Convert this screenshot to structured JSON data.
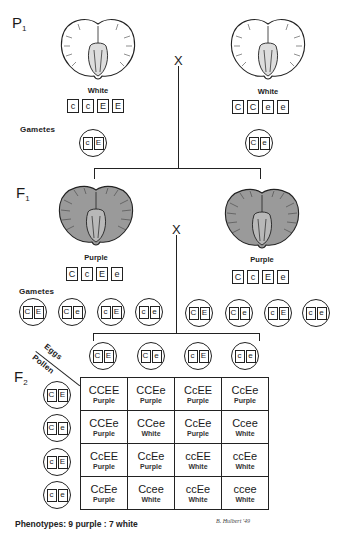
{
  "generations": {
    "p1": "P",
    "p1_sub": "1",
    "f1": "F",
    "f1_sub": "1",
    "f2": "F",
    "f2_sub": "2"
  },
  "cross_symbol": "X",
  "p1": {
    "left": {
      "phenotype": "White",
      "genotype": [
        "c",
        "c",
        "E",
        "E"
      ],
      "gamete": [
        "c",
        "E"
      ],
      "seed_color": "#ffffff"
    },
    "right": {
      "phenotype": "White",
      "genotype": [
        "C",
        "C",
        "e",
        "e"
      ],
      "gamete": [
        "C",
        "e"
      ],
      "seed_color": "#ffffff"
    },
    "gametes_label": "Gametes"
  },
  "f1": {
    "left": {
      "phenotype": "Purple",
      "genotype": [
        "C",
        "c",
        "E",
        "e"
      ],
      "seed_color": "#9a9a9a"
    },
    "right": {
      "phenotype": "Purple",
      "genotype": [
        "C",
        "c",
        "E",
        "e"
      ],
      "seed_color": "#9a9a9a"
    },
    "gametes_label": "Gametes",
    "left_gametes": [
      [
        "C",
        "E"
      ],
      [
        "C",
        "e"
      ],
      [
        "c",
        "E"
      ],
      [
        "c",
        "e"
      ]
    ],
    "right_gametes": [
      [
        "C",
        "E"
      ],
      [
        "C",
        "e"
      ],
      [
        "c",
        "E"
      ],
      [
        "c",
        "e"
      ]
    ]
  },
  "f2": {
    "eggs_label": "Eggs",
    "pollen_label": "Pollen",
    "eggs": [
      [
        "C",
        "E"
      ],
      [
        "C",
        "e"
      ],
      [
        "c",
        "E"
      ],
      [
        "c",
        "e"
      ]
    ],
    "pollen": [
      [
        "C",
        "E"
      ],
      [
        "C",
        "e"
      ],
      [
        "c",
        "E"
      ],
      [
        "c",
        "e"
      ]
    ],
    "grid": [
      [
        {
          "g": "CCEE",
          "p": "Purple"
        },
        {
          "g": "CCEe",
          "p": "Purple"
        },
        {
          "g": "CcEE",
          "p": "Purple"
        },
        {
          "g": "CcEe",
          "p": "Purple"
        }
      ],
      [
        {
          "g": "CCEe",
          "p": "Purple"
        },
        {
          "g": "CCee",
          "p": "White"
        },
        {
          "g": "CcEe",
          "p": "Purple"
        },
        {
          "g": "Ccee",
          "p": "White"
        }
      ],
      [
        {
          "g": "CcEE",
          "p": "Purple"
        },
        {
          "g": "CcEe",
          "p": "Purple"
        },
        {
          "g": "ccEE",
          "p": "White"
        },
        {
          "g": "ccEe",
          "p": "White"
        }
      ],
      [
        {
          "g": "CcEe",
          "p": "Purple"
        },
        {
          "g": "Ccee",
          "p": "White"
        },
        {
          "g": "ccEe",
          "p": "White"
        },
        {
          "g": "ccee",
          "p": "White"
        }
      ]
    ]
  },
  "footer": {
    "phenotypes": "Phenotypes: 9 purple : 7 white",
    "signature": "B. Hulbert '49"
  }
}
